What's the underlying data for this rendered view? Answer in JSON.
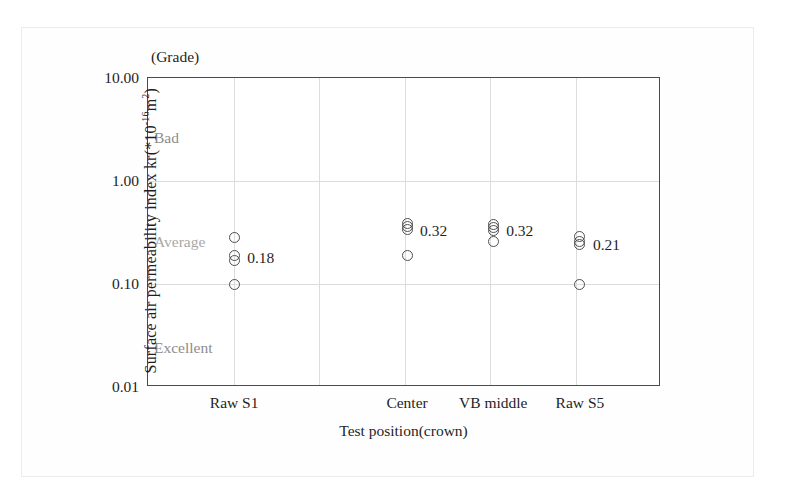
{
  "figure": {
    "grade_caption": "(Grade)",
    "grade_labels": [
      {
        "text": "Bad",
        "x": 153,
        "y": 128
      },
      {
        "text": "Average",
        "x": 153,
        "y": 232
      },
      {
        "text": "Excellent",
        "x": 153,
        "y": 338
      }
    ]
  },
  "chart_data": {
    "type": "scatter",
    "title": "",
    "xlabel": "Test position(crown)",
    "ylabel": "Surface air permeability index kr(*10-16m2)",
    "ylabel_parts": {
      "pre": "Surface air permeability index kr(*10",
      "exp": "-16",
      "post": "m",
      "post_exp": "2",
      "close": ")"
    },
    "yscale": "log",
    "ylim": [
      0.01,
      10.0
    ],
    "ytick_labels": [
      "10.00",
      "1.00",
      "0.10",
      "0.01"
    ],
    "ytick_values": [
      10.0,
      1.0,
      0.1,
      0.01
    ],
    "grid": true,
    "legend": "none",
    "categories": [
      "Raw S1",
      "Center",
      "VB middle",
      "Raw S5"
    ],
    "category_x_frac": [
      0.168,
      0.505,
      0.673,
      0.842
    ],
    "series": [
      {
        "name": "Raw S1",
        "values": [
          0.28,
          0.19,
          0.17,
          0.1
        ],
        "mean_label": "0.18"
      },
      {
        "name": "Center",
        "values": [
          0.39,
          0.36,
          0.34,
          0.19
        ],
        "mean_label": "0.32"
      },
      {
        "name": "VB middle",
        "values": [
          0.38,
          0.35,
          0.33,
          0.26
        ],
        "mean_label": "0.32"
      },
      {
        "name": "Raw S5",
        "values": [
          0.29,
          0.26,
          0.24,
          0.1
        ],
        "mean_label": "0.21"
      }
    ],
    "annotations": [
      {
        "text": "0.18",
        "value": 0.18,
        "category": "Raw S1"
      },
      {
        "text": "0.32",
        "value": 0.33,
        "category": "Center"
      },
      {
        "text": "0.32",
        "value": 0.33,
        "category": "VB middle"
      },
      {
        "text": "0.21",
        "value": 0.24,
        "category": "Raw S5"
      }
    ]
  }
}
